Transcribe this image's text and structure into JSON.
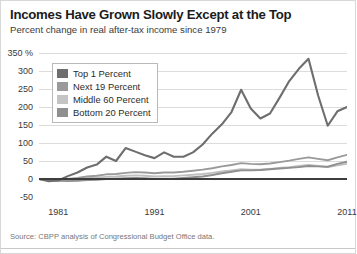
{
  "chart_data": {
    "type": "line",
    "title": "Incomes Have Grown Slowly Except at the Top",
    "subtitle": "Percent change in real after-tax income since 1979",
    "source": "Source: CBPP analysis of Congressional Budget Office data.",
    "xlabel": "",
    "ylabel": "",
    "ylim": [
      -50,
      350
    ],
    "xlim": [
      1979,
      2011
    ],
    "ytick_labels": [
      "350 %",
      "300",
      "250",
      "200",
      "150",
      "100",
      "50",
      "0",
      "-50"
    ],
    "yticks": [
      350,
      300,
      250,
      200,
      150,
      100,
      50,
      0,
      -50
    ],
    "xticks": [
      1981,
      1991,
      2001,
      2011
    ],
    "xtick_labels": [
      "1981",
      "1991",
      "2001",
      "2011"
    ],
    "grid": true,
    "legend_position": "upper left",
    "x": [
      1979,
      1980,
      1981,
      1982,
      1983,
      1984,
      1985,
      1986,
      1987,
      1988,
      1989,
      1990,
      1991,
      1992,
      1993,
      1994,
      1995,
      1996,
      1997,
      1998,
      1999,
      2000,
      2001,
      2002,
      2003,
      2004,
      2005,
      2006,
      2007,
      2008,
      2009,
      2010,
      2011
    ],
    "series": [
      {
        "name": "Top 1 Percent",
        "color": "#6e6e6e",
        "values": [
          0,
          -6,
          -4,
          8,
          18,
          32,
          40,
          62,
          50,
          86,
          76,
          66,
          58,
          74,
          62,
          62,
          74,
          96,
          126,
          152,
          186,
          248,
          196,
          168,
          182,
          226,
          272,
          306,
          334,
          232,
          148,
          188,
          200
        ]
      },
      {
        "name": "Next 19 Percent",
        "color": "#9a9a9a",
        "values": [
          0,
          -2,
          -2,
          0,
          3,
          7,
          9,
          13,
          14,
          17,
          19,
          18,
          16,
          18,
          18,
          20,
          23,
          26,
          30,
          35,
          39,
          44,
          42,
          41,
          43,
          47,
          51,
          56,
          60,
          56,
          52,
          60,
          67
        ]
      },
      {
        "name": "Middle 60 Percent",
        "color": "#bfbfbf",
        "values": [
          0,
          -3,
          -3,
          -3,
          -1,
          2,
          4,
          6,
          7,
          9,
          10,
          9,
          7,
          8,
          8,
          10,
          12,
          14,
          17,
          21,
          24,
          27,
          26,
          26,
          28,
          31,
          33,
          36,
          39,
          36,
          33,
          38,
          42
        ]
      },
      {
        "name": "Bottom 20 Percent",
        "color": "#8f8f8f",
        "values": [
          0,
          -4,
          -5,
          -6,
          -5,
          -3,
          -2,
          0,
          1,
          2,
          3,
          2,
          0,
          1,
          1,
          3,
          5,
          7,
          11,
          16,
          20,
          24,
          24,
          25,
          27,
          29,
          31,
          33,
          36,
          35,
          34,
          42,
          48
        ]
      }
    ]
  },
  "legend": {
    "items": [
      {
        "label": "Top 1 Percent",
        "color": "#6e6e6e"
      },
      {
        "label": "Next 19 Percent",
        "color": "#9a9a9a"
      },
      {
        "label": "Middle 60 Percent",
        "color": "#c4c4c4"
      },
      {
        "label": "Bottom 20 Percent",
        "color": "#8f8f8f"
      }
    ]
  }
}
